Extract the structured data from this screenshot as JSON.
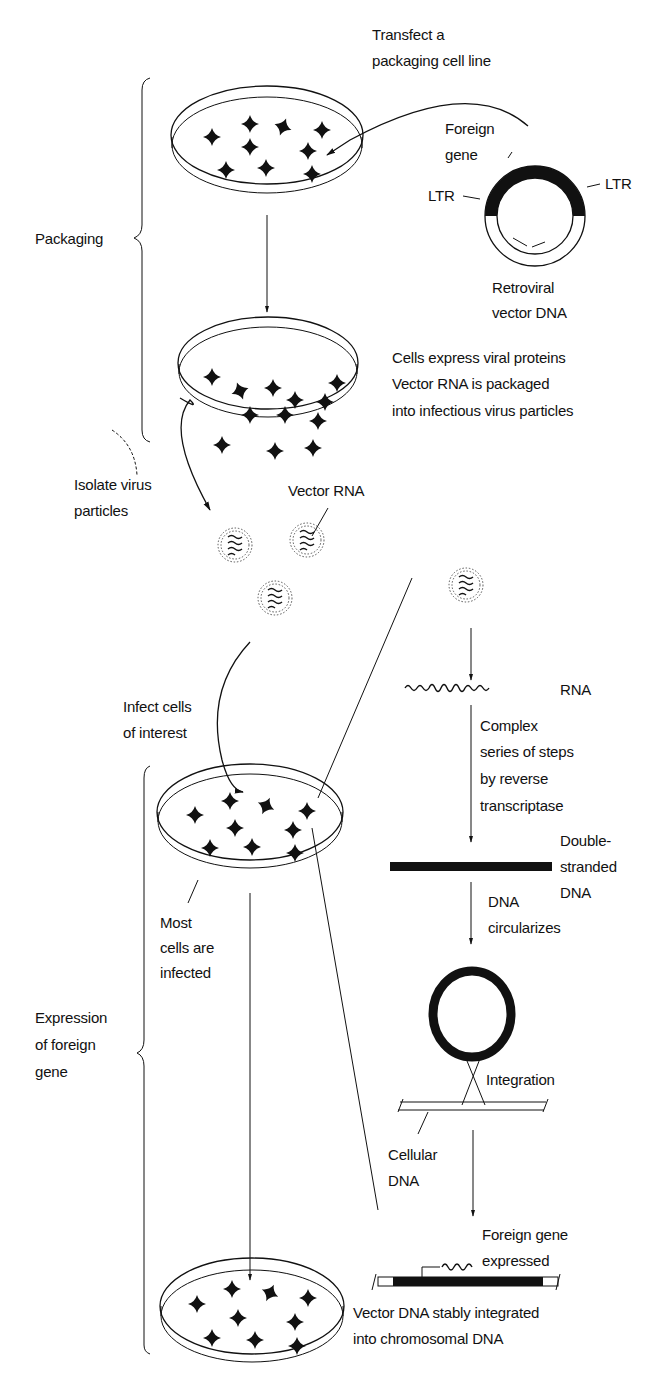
{
  "stages": {
    "packaging": "Packaging",
    "expression": [
      "Expression",
      "of foreign",
      "gene"
    ]
  },
  "labels": {
    "transfect": [
      "Transfect a",
      "packaging cell line"
    ],
    "foreign_gene": [
      "Foreign",
      "gene"
    ],
    "ltr_left": "LTR",
    "ltr_right": "LTR",
    "retroviral_vector": [
      "Retroviral",
      "vector DNA"
    ],
    "cells_express": [
      "Cells express viral proteins",
      "Vector RNA is packaged",
      "into infectious virus particles"
    ],
    "isolate": [
      "Isolate virus",
      "particles"
    ],
    "vector_rna": "Vector RNA",
    "infect": [
      "Infect cells",
      "of interest"
    ],
    "rna": "RNA",
    "complex_steps": [
      "Complex",
      "series of steps",
      "by reverse",
      "transcriptase"
    ],
    "ds_dna": [
      "Double-",
      "stranded",
      "DNA"
    ],
    "dna_circ": [
      "DNA",
      "circularizes"
    ],
    "most_cells": [
      "Most",
      "cells are",
      "infected"
    ],
    "integration": "Integration",
    "cellular_dna": [
      "Cellular",
      "DNA"
    ],
    "foreign_expressed": [
      "Foreign gene",
      "expressed"
    ],
    "stably_integrated": [
      "Vector DNA stably integrated",
      "into chromosomal DNA"
    ]
  }
}
